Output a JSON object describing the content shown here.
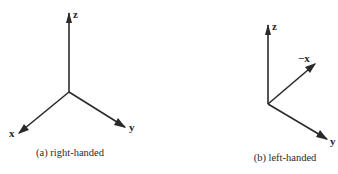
{
  "figures": [
    {
      "id": "a",
      "caption": "(a) right-handed",
      "origin": [
        69,
        92
      ],
      "axes": [
        {
          "name": "z",
          "label": "z",
          "tip": [
            69,
            13
          ],
          "label_pos": [
            73,
            18
          ]
        },
        {
          "name": "x",
          "label": "x",
          "tip": [
            19,
            133
          ],
          "label_pos": [
            9,
            137
          ]
        },
        {
          "name": "y",
          "label": "y",
          "tip": [
            125,
            127
          ],
          "label_pos": [
            129,
            131
          ]
        }
      ],
      "caption_pos": [
        70,
        156
      ]
    },
    {
      "id": "b",
      "caption": "(b) left-handed",
      "origin": [
        268,
        104
      ],
      "axes": [
        {
          "name": "z",
          "label": "z",
          "tip": [
            268,
            25
          ],
          "label_pos": [
            272,
            30
          ]
        },
        {
          "name": "neg-x",
          "label": "−x",
          "tip": [
            315,
            64
          ],
          "label_pos": [
            298,
            62
          ]
        },
        {
          "name": "y",
          "label": "y",
          "tip": [
            327,
            139
          ],
          "label_pos": [
            330,
            145
          ]
        }
      ],
      "caption_pos": [
        285,
        161
      ]
    }
  ],
  "colors": {
    "ink": "#2a2a2a",
    "background": "#ffffff"
  }
}
